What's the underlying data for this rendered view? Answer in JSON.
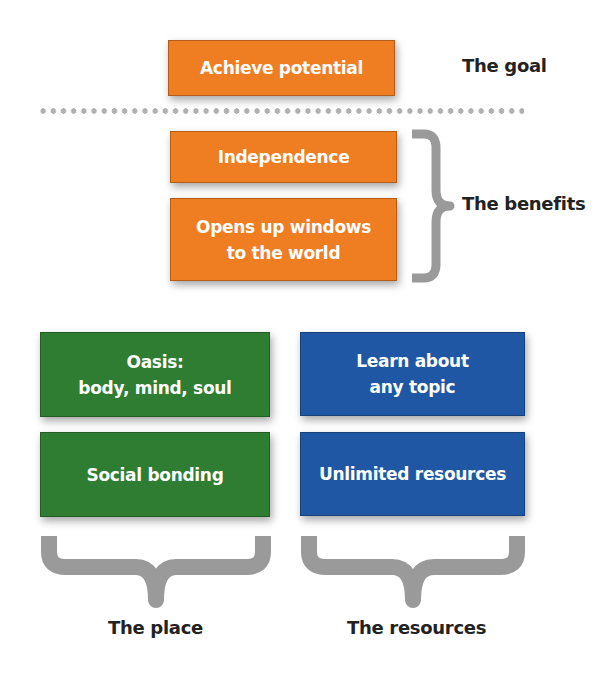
{
  "goal": {
    "box_label": "Achieve potential",
    "caption": "The goal"
  },
  "benefits": {
    "items": [
      "Independence",
      "Opens up windows\nto the world"
    ],
    "caption": "The benefits"
  },
  "place": {
    "items": [
      "Oasis:\nbody, mind, soul",
      "Social bonding"
    ],
    "caption": "The place"
  },
  "resources": {
    "items": [
      "Learn about\nany topic",
      "Unlimited resources"
    ],
    "caption": "The resources"
  },
  "colors": {
    "orange": "#ef7d22",
    "green": "#2e7d32",
    "blue": "#1f57a4",
    "brace": "#9a9a9a",
    "divider_dots": "#b0b0b0"
  }
}
